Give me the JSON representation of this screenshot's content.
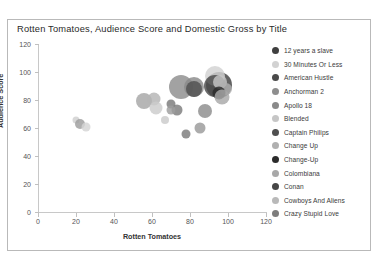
{
  "chart_data": {
    "type": "scatter",
    "title": "Rotten Tomatoes, Audience Score and Domestic Gross by Title",
    "xlabel": "Rotten Tomatoes",
    "ylabel": "Audience Score",
    "xlim": [
      0,
      120
    ],
    "ylim": [
      0,
      120
    ],
    "xticks": [
      "0",
      "20",
      "40",
      "60",
      "80",
      "100",
      "120"
    ],
    "yticks": [
      "0",
      "20",
      "40",
      "60",
      "80",
      "100",
      "120"
    ],
    "grid": false,
    "legend_position": "right",
    "size_encoding": "Domestic Gross",
    "points": [
      {
        "label": "12 years a slave",
        "x": 95,
        "y": 91,
        "size": 26,
        "color": "#3f3f3f"
      },
      {
        "label": "30 Minutes Or Less",
        "x": 93,
        "y": 97,
        "size": 20,
        "color": "#d2d2d2"
      },
      {
        "label": "American Hustle",
        "x": 93,
        "y": 90,
        "size": 22,
        "color": "#4a4a4a"
      },
      {
        "label": "Anchorman 2",
        "x": 75,
        "y": 89,
        "size": 24,
        "color": "#8e8e8e"
      },
      {
        "label": "Apollo 18",
        "x": 82,
        "y": 89,
        "size": 20,
        "color": "#8a8a8a"
      },
      {
        "label": "Blended",
        "x": 96,
        "y": 93,
        "size": 14,
        "color": "#c6c6c6"
      },
      {
        "label": "Captain Philips",
        "x": 82,
        "y": 88,
        "size": 16,
        "color": "#4f4f4f"
      },
      {
        "label": "Change Up",
        "x": 99,
        "y": 88,
        "size": 12,
        "color": "#b0b0b0"
      },
      {
        "label": "Change-Up",
        "x": 95,
        "y": 85,
        "size": 13,
        "color": "#2b2b2b"
      },
      {
        "label": "Colombiana",
        "x": 97,
        "y": 82,
        "size": 15,
        "color": "#a8a8a8"
      },
      {
        "label": "Conan",
        "x": 88,
        "y": 72,
        "size": 14,
        "color": "#8c8c8c"
      },
      {
        "label": "Cowboys And Aliens",
        "x": 85,
        "y": 60,
        "size": 11,
        "color": "#9a9a9a"
      },
      {
        "label": "Crazy Stupid Love",
        "x": 73,
        "y": 73,
        "size": 11,
        "color": "#7d7d7d"
      },
      {
        "label": "",
        "x": 56,
        "y": 79,
        "size": 16,
        "color": "#a6a6a6"
      },
      {
        "label": "",
        "x": 61,
        "y": 81,
        "size": 13,
        "color": "#b4b4b4"
      },
      {
        "label": "",
        "x": 62,
        "y": 74,
        "size": 13,
        "color": "#cccccc"
      },
      {
        "label": "",
        "x": 70,
        "y": 77,
        "size": 9,
        "color": "#7a7a7a"
      },
      {
        "label": "",
        "x": 70,
        "y": 73,
        "size": 9,
        "color": "#9e9e9e"
      },
      {
        "label": "",
        "x": 67,
        "y": 66,
        "size": 8,
        "color": "#cacaca"
      },
      {
        "label": "",
        "x": 78,
        "y": 56,
        "size": 9,
        "color": "#7b7b7b"
      },
      {
        "label": "",
        "x": 20,
        "y": 66,
        "size": 7,
        "color": "#cfcfcf"
      },
      {
        "label": "",
        "x": 22,
        "y": 63,
        "size": 10,
        "color": "#9d9d9d"
      },
      {
        "label": "",
        "x": 25,
        "y": 61,
        "size": 9,
        "color": "#d4d4d4"
      }
    ]
  },
  "legend": {
    "items": [
      {
        "label": "12 years a slave",
        "color": "#3f3f3f"
      },
      {
        "label": "30 Minutes Or Less",
        "color": "#d2d2d2"
      },
      {
        "label": "American Hustle",
        "color": "#4a4a4a"
      },
      {
        "label": "Anchorman 2",
        "color": "#8e8e8e"
      },
      {
        "label": "Apollo 18",
        "color": "#8a8a8a"
      },
      {
        "label": "Blended",
        "color": "#c6c6c6"
      },
      {
        "label": "Captain Philips",
        "color": "#4f4f4f"
      },
      {
        "label": "Change Up",
        "color": "#b0b0b0"
      },
      {
        "label": "Change-Up",
        "color": "#2b2b2b"
      },
      {
        "label": "Colombiana",
        "color": "#a8a8a8"
      },
      {
        "label": "Conan",
        "color": "#474747"
      },
      {
        "label": "Cowboys And Aliens",
        "color": "#b9b9b9"
      },
      {
        "label": "Crazy Stupid Love",
        "color": "#7d7d7d"
      }
    ]
  }
}
